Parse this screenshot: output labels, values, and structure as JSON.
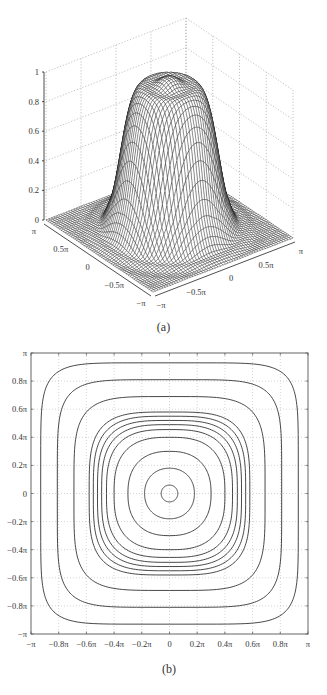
{
  "chart_data": [
    {
      "id": "a",
      "type": "surface3d",
      "caption": "(a)",
      "title": "",
      "function_description": "Smooth circular top-hat (low-pass filter magnitude response) over [-pi, pi] x [-pi, pi]; plateau ~1 inside radius ~0.45pi with slight ripple on top, falls to 0 around radius ~0.6pi, small ripples near the square edges",
      "zlabel": "",
      "zlim": [
        0,
        1
      ],
      "z_ticks": [
        "0",
        "0.2",
        "0.4",
        "0.6",
        "0.8",
        "1"
      ],
      "x_ticks": [
        "-π",
        "-0.5π",
        "0",
        "0.5π",
        "π"
      ],
      "y_ticks": [
        "π",
        "0.5π",
        "0",
        "-0.5π",
        "-π"
      ],
      "xlim": [
        "-π",
        "π"
      ],
      "ylim": [
        "-π",
        "π"
      ],
      "grid": true,
      "style": "black wireframe mesh"
    },
    {
      "id": "b",
      "type": "contour",
      "caption": "(b)",
      "title": "",
      "xlabel": "",
      "ylabel": "",
      "xlim": [
        -1,
        1
      ],
      "ylim": [
        -1,
        1
      ],
      "units": "π",
      "x_ticks": [
        "-π",
        "-0.8π",
        "-0.6π",
        "-0.4π",
        "-0.2π",
        "0",
        "0.2π",
        "0.4π",
        "0.6π",
        "0.8π",
        "π"
      ],
      "y_ticks": [
        "π",
        "0.8π",
        "0.6π",
        "0.4π",
        "0.2π",
        "0",
        "-0.2π",
        "-0.4π",
        "-0.6π",
        "-0.8π",
        "-π"
      ],
      "grid": true,
      "contour_half_widths_in_pi": [
        0.06,
        0.18,
        0.3,
        0.4,
        0.455,
        0.49,
        0.52,
        0.55,
        0.58,
        0.69,
        0.81,
        0.93
      ],
      "contour_shape": "concentric closed curves, circular near center becoming rounded squares toward the edges"
    }
  ]
}
